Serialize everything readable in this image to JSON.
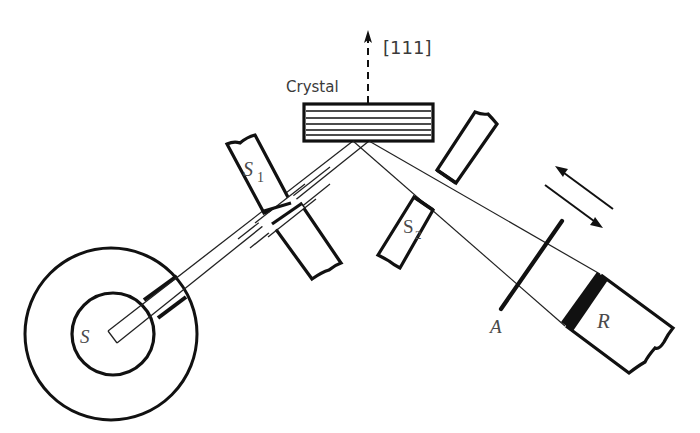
{
  "figure": {
    "labels": {
      "crystal": "Crystal",
      "direction": "[111]",
      "source": "S",
      "slit1_main": "S",
      "slit1_sub": "1",
      "slit2_main": "S",
      "slit2_sub": "2",
      "absorber": "A",
      "receiver": "R"
    },
    "components": [
      {
        "id": "source",
        "label": "S",
        "description": "Source in shielded housing (two concentric circles)"
      },
      {
        "id": "slit-1",
        "label": "S1",
        "description": "Collimating slit on incident beam"
      },
      {
        "id": "crystal",
        "label": "Crystal",
        "description": "Layered crystal, surface normal along [111]"
      },
      {
        "id": "slit-2",
        "label": "S2",
        "description": "Slit on diffracted beam"
      },
      {
        "id": "absorber",
        "label": "A",
        "description": "Absorber plate"
      },
      {
        "id": "receiver",
        "label": "R",
        "description": "Detector / receiver"
      },
      {
        "id": "motion-arrows",
        "label": "",
        "description": "Double arrow indicating translation of detector assembly"
      }
    ],
    "colors": {
      "ink": "#111111",
      "label": "#444444",
      "background": "#ffffff"
    }
  }
}
